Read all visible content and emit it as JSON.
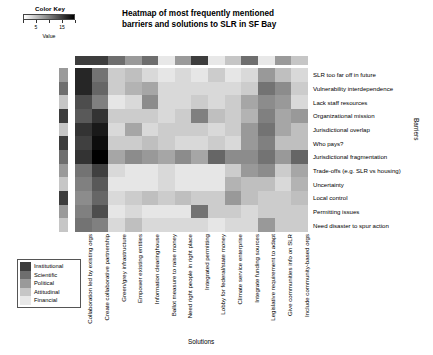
{
  "color_key": {
    "title": "Color Key",
    "axis_label": "Value",
    "tick_values": [
      5,
      15
    ],
    "tick_labels": [
      "5",
      "15"
    ],
    "scale_min": 0,
    "scale_max": 20,
    "gradient_low_color": "#ffffff",
    "gradient_high_color": "#000000"
  },
  "title": {
    "line1": "Heatmap of most frequently mentioned",
    "line2": "barriers and solutions to SLR in SF Bay"
  },
  "axes": {
    "rows_axis_label": "Barriers",
    "cols_axis_label": "Solutions"
  },
  "category_legend": {
    "items": [
      {
        "label": "Institutional",
        "color": "#3d3d3d"
      },
      {
        "label": "Scientific",
        "color": "#6e6e6e"
      },
      {
        "label": "Political",
        "color": "#9a9a9a"
      },
      {
        "label": "Attitudinal",
        "color": "#c6c6c6"
      },
      {
        "label": "Financial",
        "color": "#e8e8e8"
      }
    ]
  },
  "chart_data": {
    "type": "heatmap",
    "title": "Heatmap of most frequently mentioned barriers and solutions to SLR in SF Bay",
    "xlabel": "Solutions",
    "ylabel": "Barriers",
    "value_label": "Value",
    "zlim": [
      0,
      20
    ],
    "colormap": "grayscale (white = low, black = high)",
    "grid": false,
    "legend_position": "bottom-left",
    "colorbar_position": "top-left",
    "columns": [
      "Collaboration led by existing orgs",
      "Create collaborative partnership",
      "Green/grey infrastructure",
      "Empower existing entities",
      "Information clearinghouse",
      "Ballot measure to raise money",
      "Need right people in right place",
      "Integrated permitting",
      "Lobby for federal/state money",
      "Climate service enterprise",
      "Integrate funding sources",
      "Legislative requirement to adapt",
      "Give communities info on SLR",
      "Include community-based orgs"
    ],
    "rows": [
      "SLR too far off in future",
      "Vulnerability interdependence",
      "Lack staff resources",
      "Organizational mission",
      "Jurisdictional overlap",
      "Who pays?",
      "Jurisdictional fragmentation",
      "Trade-offs (e.g. SLR vs housing)",
      "Uncertainty",
      "Local control",
      "Permitting issues",
      "Need disaster to spur action"
    ],
    "row_categories": [
      "Political",
      "Scientific",
      "Attitudinal",
      "Institutional",
      "Attitudinal",
      "Institutional",
      "Scientific",
      "Political",
      "Attitudinal",
      "Institutional",
      "Political",
      "Attitudinal"
    ],
    "column_categories": [
      "Institutional",
      "Institutional",
      "Scientific",
      "Political",
      "Scientific",
      "Financial",
      "Political",
      "Institutional",
      "Financial",
      "Attitudinal",
      "Scientific",
      "Financial",
      "Political",
      "Attitudinal",
      "Political"
    ],
    "values": [
      [
        17,
        11,
        4,
        5,
        3,
        2,
        3,
        2,
        4,
        2,
        3,
        8,
        5,
        3
      ],
      [
        17,
        12,
        4,
        6,
        7,
        3,
        3,
        3,
        3,
        3,
        4,
        11,
        9,
        4
      ],
      [
        14,
        10,
        2,
        3,
        9,
        3,
        3,
        4,
        3,
        4,
        7,
        9,
        8,
        3
      ],
      [
        13,
        16,
        4,
        4,
        4,
        3,
        4,
        10,
        5,
        4,
        6,
        10,
        7,
        8
      ],
      [
        16,
        18,
        3,
        7,
        3,
        4,
        4,
        4,
        3,
        4,
        8,
        11,
        7,
        5
      ],
      [
        15,
        19,
        4,
        4,
        5,
        4,
        3,
        3,
        4,
        3,
        8,
        10,
        5,
        5
      ],
      [
        16,
        20,
        7,
        9,
        8,
        7,
        9,
        7,
        12,
        9,
        9,
        11,
        8,
        12
      ],
      [
        11,
        15,
        3,
        2,
        2,
        3,
        2,
        2,
        2,
        4,
        8,
        9,
        4,
        7
      ],
      [
        10,
        13,
        2,
        2,
        2,
        3,
        2,
        2,
        2,
        6,
        5,
        5,
        3,
        6
      ],
      [
        9,
        12,
        3,
        4,
        5,
        4,
        5,
        4,
        4,
        8,
        5,
        4,
        4,
        5
      ],
      [
        10,
        14,
        2,
        3,
        2,
        2,
        2,
        11,
        4,
        4,
        3,
        4,
        4,
        4
      ],
      [
        11,
        10,
        3,
        5,
        3,
        3,
        3,
        3,
        2,
        3,
        3,
        8,
        4,
        4
      ]
    ]
  }
}
